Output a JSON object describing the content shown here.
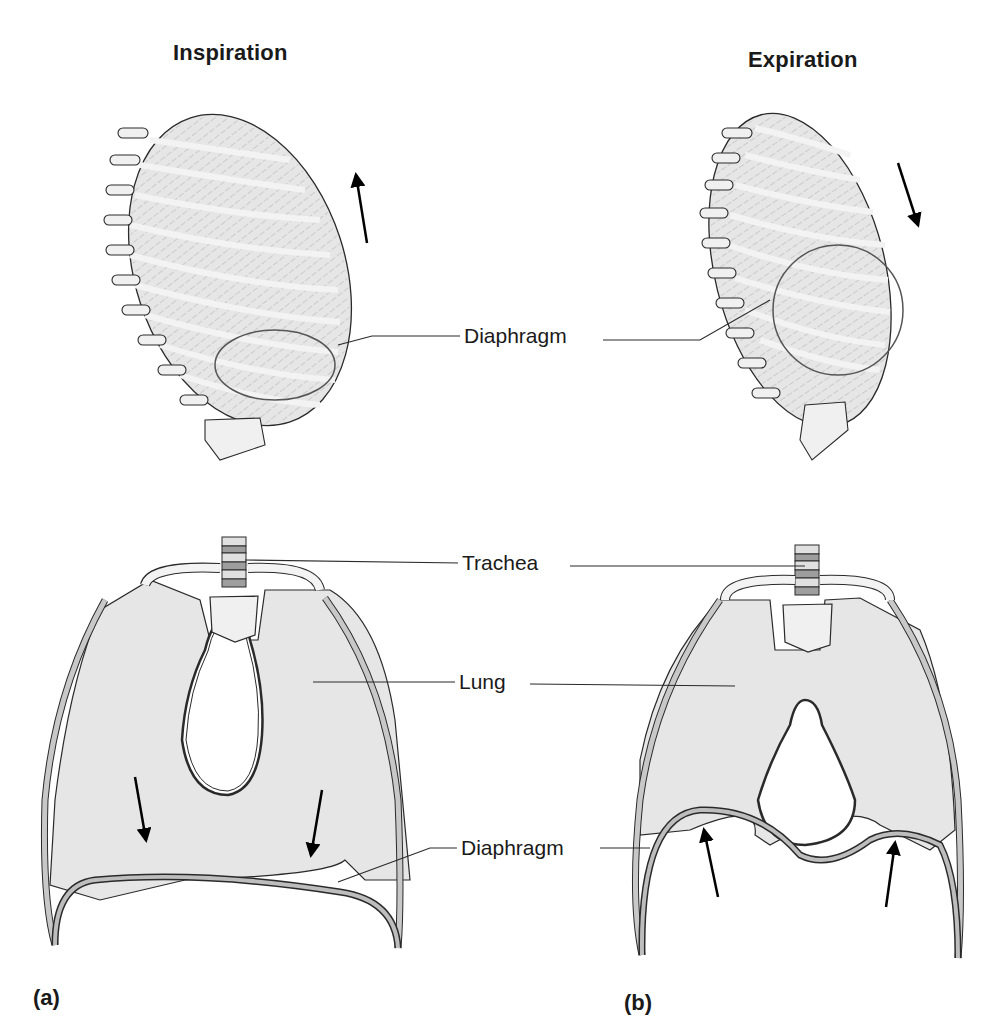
{
  "figure": {
    "columns": [
      {
        "id": "a",
        "heading": "Inspiration",
        "panel_letter": "(a)",
        "arrow_direction_rib_cage": "up",
        "arrow_direction_diaphragm": "down"
      },
      {
        "id": "b",
        "heading": "Expiration",
        "panel_letter": "(b)",
        "arrow_direction_rib_cage": "down",
        "arrow_direction_diaphragm": "up"
      }
    ],
    "labels": {
      "diaphragm_top": "Diaphragm",
      "trachea": "Trachea",
      "lung": "Lung",
      "diaphragm_bottom": "Diaphragm"
    },
    "colors": {
      "tissue_fill": "#e6e6e6",
      "bone_fill": "#f0f0f0",
      "cartilage_fill": "#bdbdbd",
      "outline": "#2a2a2a",
      "arrow": "#000000"
    }
  }
}
